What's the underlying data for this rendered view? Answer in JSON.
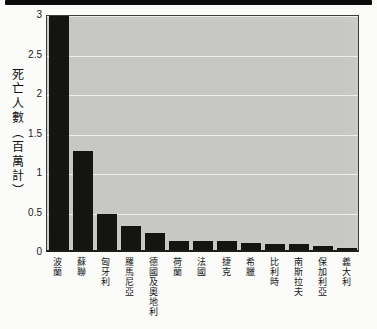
{
  "figure": {
    "top_rule_color": "#0b0b0b",
    "background": "#fbfbfa"
  },
  "chart_data": {
    "type": "bar",
    "title": "",
    "xlabel": "",
    "ylabel": "死亡人數（百萬計）",
    "categories": [
      "波蘭",
      "蘇聯",
      "匈牙利",
      "羅馬尼亞",
      "德國及奧地利",
      "荷蘭",
      "法國",
      "捷克",
      "希臘",
      "比利時",
      "南斯拉夫",
      "保加利亞",
      "義大利"
    ],
    "values": [
      3.0,
      1.25,
      0.45,
      0.3,
      0.22,
      0.12,
      0.11,
      0.11,
      0.09,
      0.07,
      0.07,
      0.045,
      0.02
    ],
    "ylim": [
      0,
      3.0
    ],
    "yticks": [
      0,
      0.5,
      1,
      1.5,
      2,
      2.5,
      3
    ],
    "ytick_labels": [
      "0",
      "0.5",
      "1",
      "1.5",
      "2",
      "2.5",
      "3"
    ],
    "grid": true,
    "legend": false,
    "bar_color": "#141413",
    "plot_background": "#c7c7c6",
    "gridline_color": "#f1f1ef"
  }
}
